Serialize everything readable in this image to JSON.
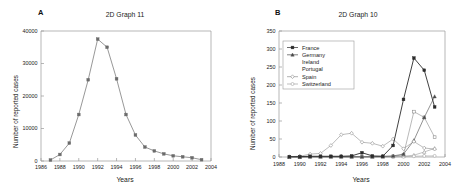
{
  "figure": {
    "background": "#ffffff",
    "axis_color": "#9a9a9a",
    "text_color": "#1a1a1a"
  },
  "panels": [
    {
      "letter": "A",
      "title": "2D Graph 11",
      "xlabel": "Years",
      "ylabel": "Number of reported cases"
    },
    {
      "letter": "B",
      "title": "2D Graph 10",
      "xlabel": "Years",
      "ylabel": "Number of reported cases"
    }
  ],
  "chart_data": [
    {
      "panel": "A",
      "type": "line",
      "title": "2D Graph 11",
      "xlabel": "Years",
      "ylabel": "Number of reported cases",
      "xlim": [
        1986,
        2004
      ],
      "ylim": [
        0,
        40000
      ],
      "xticks": [
        1986,
        1988,
        1990,
        1992,
        1994,
        1996,
        1998,
        2000,
        2002,
        2004
      ],
      "yticks": [
        0,
        10000,
        20000,
        30000,
        40000
      ],
      "grid": false,
      "legend": "none",
      "marker": "square",
      "line_color": "#6b6b6b",
      "series": [
        {
          "name": "Total reported cases",
          "x": [
            1987,
            1988,
            1989,
            1990,
            1991,
            1992,
            1993,
            1994,
            1995,
            1996,
            1997,
            1998,
            1999,
            2000,
            2001,
            2002,
            2003
          ],
          "values": [
            300,
            2000,
            5500,
            14300,
            25000,
            37500,
            35000,
            25300,
            14300,
            8000,
            4300,
            3100,
            2200,
            1600,
            1300,
            1000,
            400
          ]
        }
      ]
    },
    {
      "panel": "B",
      "type": "line",
      "title": "2D Graph 10",
      "xlabel": "Years",
      "ylabel": "Number of reported cases",
      "xlim": [
        1988,
        2004
      ],
      "ylim": [
        0,
        350
      ],
      "xticks": [
        1988,
        1990,
        1992,
        1994,
        1996,
        1998,
        2000,
        2002,
        2004
      ],
      "yticks": [
        0,
        50,
        100,
        150,
        200,
        250,
        300,
        350
      ],
      "grid": false,
      "legend": "inside-top-left",
      "legend_entries": [
        "France",
        "Germany",
        "Ireland",
        "Portugal",
        "Spain",
        "Switzerland"
      ],
      "series": [
        {
          "name": "France",
          "marker": "filled-square",
          "color": "#2b2b2b",
          "x": [
            1989,
            1990,
            1991,
            1992,
            1993,
            1994,
            1995,
            1996,
            1997,
            1998,
            1999,
            2000,
            2001,
            2002,
            2003
          ],
          "values": [
            1,
            1,
            2,
            2,
            2,
            2,
            3,
            12,
            3,
            2,
            32,
            160,
            275,
            241,
            139
          ]
        },
        {
          "name": "Germany",
          "marker": "filled-triangle",
          "color": "#4a4a4a",
          "x": [
            1989,
            1990,
            1991,
            1992,
            1993,
            1994,
            1995,
            1996,
            1997,
            1998,
            1999,
            2000,
            2001,
            2002,
            2003
          ],
          "values": [
            0,
            0,
            1,
            1,
            1,
            1,
            1,
            1,
            1,
            2,
            3,
            8,
            46,
            110,
            168
          ]
        },
        {
          "name": "Ireland",
          "marker": "open-square",
          "color": "#8a8a8a",
          "x": [
            1989,
            1990,
            1991,
            1992,
            1993,
            1994,
            1995,
            1996,
            1997,
            1998,
            1999,
            2000,
            2001,
            2002,
            2003
          ],
          "values": [
            0,
            0,
            0,
            0,
            0,
            0,
            0,
            0,
            0,
            1,
            2,
            6,
            126,
            110,
            55
          ]
        },
        {
          "name": "Portugal",
          "marker": "open-triangle",
          "color": "#9a9a9a",
          "x": [
            1989,
            1990,
            1991,
            1992,
            1993,
            1994,
            1995,
            1996,
            1997,
            1998,
            1999,
            2000,
            2001,
            2002,
            2003
          ],
          "values": [
            0,
            0,
            0,
            0,
            0,
            0,
            0,
            0,
            0,
            0,
            1,
            2,
            5,
            14,
            24
          ]
        },
        {
          "name": "Spain",
          "marker": "open-diamond",
          "color": "#8f8f8f",
          "x": [
            1989,
            1990,
            1991,
            1992,
            1993,
            1994,
            1995,
            1996,
            1997,
            1998,
            1999,
            2000,
            2001,
            2002,
            2003
          ],
          "values": [
            1,
            2,
            8,
            10,
            32,
            62,
            66,
            41,
            38,
            30,
            50,
            23,
            43,
            25,
            22
          ]
        },
        {
          "name": "Switzerland",
          "marker": "open-circle",
          "color": "#a5a5a5",
          "x": [
            1989,
            1990,
            1991,
            1992,
            1993,
            1994,
            1995,
            1996,
            1997,
            1998,
            1999,
            2000,
            2001,
            2002,
            2003
          ],
          "values": [
            0,
            0,
            0,
            0,
            0,
            0,
            0,
            0,
            0,
            0,
            0,
            1,
            2,
            3,
            3
          ]
        }
      ]
    }
  ]
}
